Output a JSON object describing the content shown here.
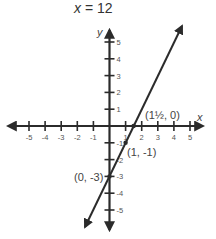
{
  "title": {
    "var": "x",
    "rest": " = 12"
  },
  "axes": {
    "x_label": "x",
    "y_label": "y",
    "x_ticks": [
      "-5",
      "-4",
      "-3",
      "-2",
      "-1",
      "1",
      "2",
      "3",
      "4",
      "5"
    ],
    "y_ticks": [
      "5",
      "4",
      "3",
      "2",
      "1",
      "-1",
      "-2",
      "-3",
      "-4",
      "-5"
    ],
    "range": [
      -5,
      5
    ]
  },
  "points": [
    {
      "label": "(1½, 0)",
      "x": 1.5,
      "y": 0
    },
    {
      "label": "(1, -1)",
      "x": 1,
      "y": -1
    },
    {
      "label": "(0, -3)",
      "x": 0,
      "y": -3
    }
  ],
  "line": {
    "equation": "y = 2x - 3",
    "slope": 2,
    "intercept": -3
  },
  "colors": {
    "ink": "#2b2b2b",
    "text": "#444444"
  }
}
